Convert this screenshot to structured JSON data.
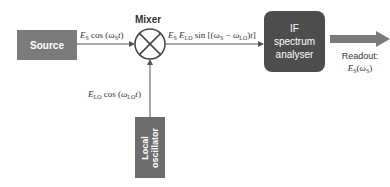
{
  "diagram": {
    "source": {
      "label": "Source"
    },
    "mixer": {
      "label": "Mixer"
    },
    "if_analyser": {
      "label_lines": [
        "IF",
        "spectrum",
        "analyser"
      ]
    },
    "local_oscillator": {
      "label_lines": [
        "Local",
        "oscillator"
      ]
    },
    "signals": {
      "source_to_mixer": "E_S cos (ω_S t)",
      "lo_to_mixer": "E_LO cos (ω_LO t)",
      "mixer_to_if": "E_S E_LO sin [(ω_S − ω_LO)t]"
    },
    "readout": {
      "label": "Readout:",
      "value": "E_S(ω_S)"
    }
  },
  "colors": {
    "source_box": "#7b7b7b",
    "if_box": "#4d4d4d",
    "lo_box": "#6d6d6d",
    "output_arrow": "#7a7a7a",
    "lines": "#555555"
  }
}
